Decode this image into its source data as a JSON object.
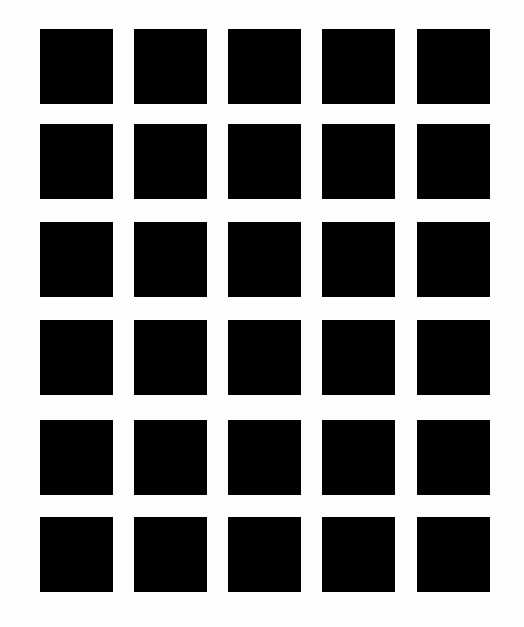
{
  "figure": {
    "type": "hermann-grid",
    "rows": 6,
    "columns": 5,
    "square_color": "#000000",
    "background_color": "#fdfdfd",
    "square_width": 73,
    "square_height": 75,
    "column_x": [
      40,
      134,
      228,
      322,
      417
    ],
    "row_y": [
      29,
      124,
      222,
      320,
      420,
      517
    ]
  }
}
